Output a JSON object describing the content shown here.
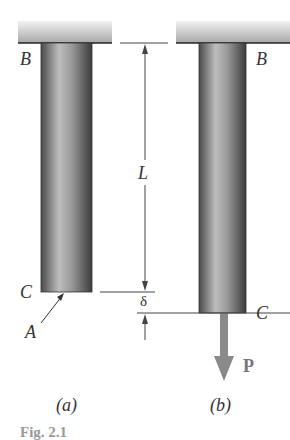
{
  "figure": {
    "panel_a": {
      "caption": "(a)",
      "top_label": "B",
      "bottom_label": "C",
      "area_label": "A"
    },
    "panel_b": {
      "caption": "(b)",
      "top_label": "B",
      "bottom_label": "C",
      "load_label": "P"
    },
    "dimensions": {
      "length_label": "L",
      "elongation_label": "δ"
    },
    "fig_caption": "Fig. 2.1"
  },
  "colors": {
    "rod_dark": "#555555",
    "rod_light": "#bdbdbd",
    "wall": "#cfcfcf",
    "load_arrow": "#8a8a8a",
    "line": "#444444"
  }
}
